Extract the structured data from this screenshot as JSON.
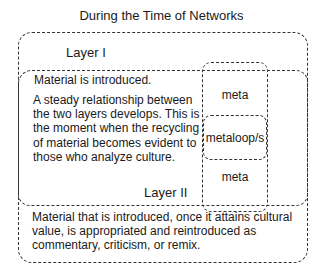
{
  "title": "During the Time of Networks",
  "layer1": {
    "label": "Layer I"
  },
  "layer2": {
    "label": "Layer II",
    "intro": "Material is introduced.",
    "paragraph": "A steady relationship between the two layers develops. This is the moment when the recycling of material becomes evident to those who analyze culture."
  },
  "bottom_text": "Material that is introduced, once it attains cultural value, is appropriated and reintroduced as commentary, criticism, or remix.",
  "meta_column": {
    "top": "meta",
    "middle": "metaloop/s",
    "bottom": "meta"
  }
}
